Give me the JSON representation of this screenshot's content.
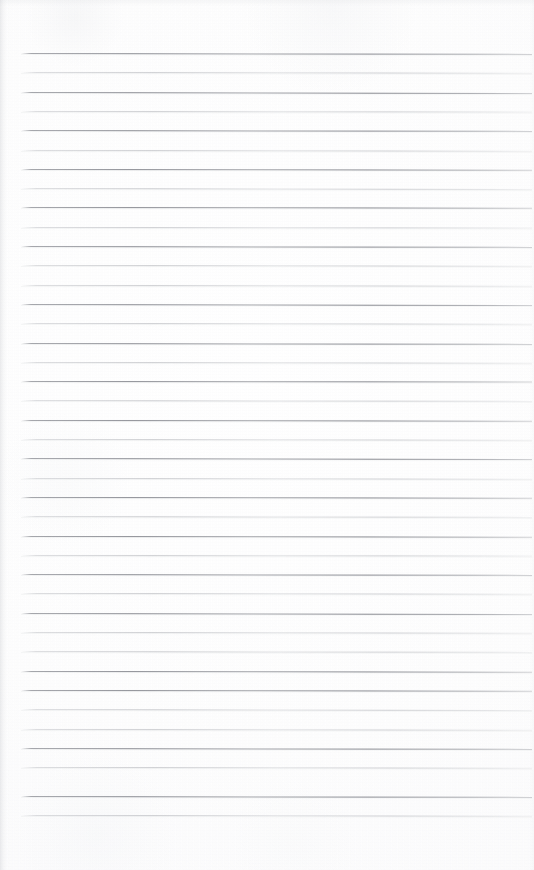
{
  "document": {
    "kind": "scanned-ruled-notebook-page",
    "title": "Blank lined notebook page",
    "page_width": 534,
    "page_height": 870,
    "text_content": "",
    "has_handwriting": false,
    "has_printed_text": false
  },
  "paper": {
    "background_color": "#fefefe",
    "base_tone_color": "#fbfbfc",
    "edge_shade_color": "#bec0c4",
    "left_margin_x": 21,
    "right_margin_x": 532,
    "top_blank_height": 53,
    "bottom_blank_height": 55
  },
  "ruling": {
    "style": "horizontal-lined",
    "line_count": 40,
    "first_line_y": 53,
    "last_line_y": 815,
    "line_spacing": 19.3,
    "line_thickness": 1,
    "line_start_x": 21,
    "line_end_x": 532,
    "dark_line_color": "#767880",
    "light_line_color": "#a4a6ac",
    "alternating_weight": true,
    "slope_degrees": 0.09,
    "lines": [
      {
        "index": 1,
        "y": 53.0,
        "weight": "dark",
        "slope": 0.1
      },
      {
        "index": 2,
        "y": 72.3,
        "weight": "light",
        "slope": 0.08
      },
      {
        "index": 3,
        "y": 91.6,
        "weight": "dark",
        "slope": 0.11
      },
      {
        "index": 4,
        "y": 110.9,
        "weight": "light",
        "slope": 0.07
      },
      {
        "index": 5,
        "y": 130.2,
        "weight": "dark",
        "slope": 0.1
      },
      {
        "index": 6,
        "y": 149.5,
        "weight": "light",
        "slope": 0.09
      },
      {
        "index": 7,
        "y": 168.8,
        "weight": "dark",
        "slope": 0.08
      },
      {
        "index": 8,
        "y": 188.1,
        "weight": "light",
        "slope": 0.11
      },
      {
        "index": 9,
        "y": 207.4,
        "weight": "dark",
        "slope": 0.09
      },
      {
        "index": 10,
        "y": 226.7,
        "weight": "light",
        "slope": 0.07
      },
      {
        "index": 11,
        "y": 246.0,
        "weight": "dark",
        "slope": 0.1
      },
      {
        "index": 12,
        "y": 265.3,
        "weight": "light",
        "slope": 0.08
      },
      {
        "index": 13,
        "y": 284.6,
        "weight": "light",
        "slope": 0.09
      },
      {
        "index": 14,
        "y": 303.9,
        "weight": "dark",
        "slope": 0.11
      },
      {
        "index": 15,
        "y": 323.2,
        "weight": "light",
        "slope": 0.08
      },
      {
        "index": 16,
        "y": 342.5,
        "weight": "dark",
        "slope": 0.1
      },
      {
        "index": 17,
        "y": 361.8,
        "weight": "light",
        "slope": 0.09
      },
      {
        "index": 18,
        "y": 381.1,
        "weight": "dark",
        "slope": 0.07
      },
      {
        "index": 19,
        "y": 400.4,
        "weight": "light",
        "slope": 0.1
      },
      {
        "index": 20,
        "y": 419.7,
        "weight": "dark",
        "slope": 0.09
      },
      {
        "index": 21,
        "y": 439.0,
        "weight": "light",
        "slope": 0.08
      },
      {
        "index": 22,
        "y": 458.3,
        "weight": "dark",
        "slope": 0.11
      },
      {
        "index": 23,
        "y": 477.6,
        "weight": "light",
        "slope": 0.09
      },
      {
        "index": 24,
        "y": 496.9,
        "weight": "dark",
        "slope": 0.08
      },
      {
        "index": 25,
        "y": 516.2,
        "weight": "light",
        "slope": 0.1
      },
      {
        "index": 26,
        "y": 535.5,
        "weight": "dark",
        "slope": 0.09
      },
      {
        "index": 27,
        "y": 554.8,
        "weight": "light",
        "slope": 0.07
      },
      {
        "index": 28,
        "y": 574.1,
        "weight": "dark",
        "slope": 0.1
      },
      {
        "index": 29,
        "y": 593.4,
        "weight": "light",
        "slope": 0.09
      },
      {
        "index": 30,
        "y": 612.7,
        "weight": "dark",
        "slope": 0.11
      },
      {
        "index": 31,
        "y": 632.0,
        "weight": "light",
        "slope": 0.08
      },
      {
        "index": 32,
        "y": 651.3,
        "weight": "light",
        "slope": 0.1
      },
      {
        "index": 33,
        "y": 670.6,
        "weight": "dark",
        "slope": 0.09
      },
      {
        "index": 34,
        "y": 689.9,
        "weight": "dark",
        "slope": 0.08
      },
      {
        "index": 35,
        "y": 709.2,
        "weight": "light",
        "slope": 0.11
      },
      {
        "index": 36,
        "y": 728.5,
        "weight": "light",
        "slope": 0.09
      },
      {
        "index": 37,
        "y": 747.8,
        "weight": "dark",
        "slope": 0.1
      },
      {
        "index": 38,
        "y": 767.1,
        "weight": "light",
        "slope": 0.08
      },
      {
        "index": 39,
        "y": 796.0,
        "weight": "dark",
        "slope": 0.1
      },
      {
        "index": 40,
        "y": 815.3,
        "weight": "light",
        "slope": 0.09
      }
    ]
  }
}
